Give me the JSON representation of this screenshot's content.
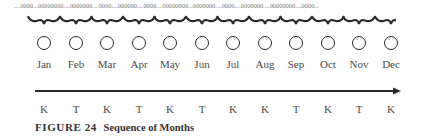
{
  "diagram": {
    "top_sequence": "....0000...00000000....0000000....0000....000000....0000....00000000...0000000....0000....0000000....00000000....0000...",
    "months": [
      "Jan",
      "Feb",
      "Mar",
      "Apr",
      "May",
      "Jun",
      "Jul",
      "Aug",
      "Sep",
      "Oct",
      "Nov",
      "Dec"
    ],
    "letters": [
      "K",
      "T",
      "K",
      "T",
      "K",
      "T",
      "K",
      "K",
      "T",
      "K",
      "T",
      "K"
    ],
    "positions_x": [
      44,
      76,
      107,
      139,
      170,
      202,
      233,
      265,
      296,
      328,
      359,
      391
    ],
    "circle_symbol": "circle-icon",
    "arrow_direction": "right",
    "colors": {
      "stroke": "#2a2a2a",
      "text": "#4a4a4a",
      "dots": "#7a7a7a"
    }
  },
  "caption": {
    "label": "FIGURE 24",
    "title": "Sequence of Months"
  }
}
